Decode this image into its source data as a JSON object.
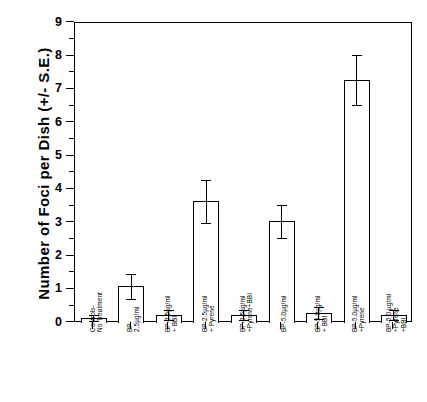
{
  "chart_data": {
    "type": "bar",
    "title": "",
    "xlabel": "",
    "ylabel": "Number of Foci per Dish (+/- S.E.)",
    "ylim": [
      0,
      9
    ],
    "ytick_labels": [
      "0",
      "1",
      "2",
      "3",
      "4",
      "5",
      "6",
      "7",
      "8",
      "9"
    ],
    "ytick_values": [
      0,
      1,
      2,
      3,
      4,
      5,
      6,
      7,
      8,
      9
    ],
    "minor_ticks": true,
    "grid": false,
    "legend": false,
    "categories": [
      "Controls-\nNo Treatment",
      "BP-\n2.5µg/ml",
      "BP-2.5µg/ml\n+ BBI",
      "BP-2.5µg/ml\n+ Pyrene",
      "BP-2.5µg/ml\n+Pyrene+BBI",
      "BP-5.0µg/ml",
      "BP-5.0µg/ml\n+ BBI",
      "BP-5.0µg/ml\n+Pyrene",
      "BP-5.0 µg/ml\n+Pyrene\n+BBI"
    ],
    "values": [
      0.15,
      1.1,
      0.25,
      3.65,
      0.25,
      3.05,
      0.3,
      7.3,
      0.25
    ],
    "errors": [
      0.1,
      0.38,
      0.15,
      0.65,
      0.15,
      0.5,
      0.18,
      0.75,
      0.15
    ],
    "bar_color": "#ffffff",
    "bar_edge_color": "#000000",
    "axis_color": "#000000"
  },
  "axis": {
    "y_title": "Number of Foci per Dish (+/- S.E.)"
  }
}
